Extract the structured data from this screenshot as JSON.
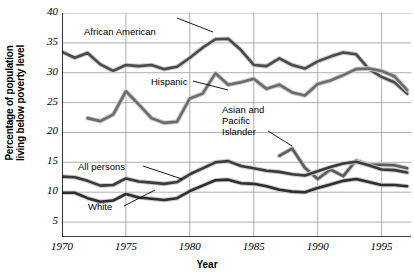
{
  "chart_data": {
    "type": "line",
    "title": "",
    "xlabel": "Year",
    "ylabel": "Percentage of population living below poverty level",
    "ylabel_line1": "Percentage of population",
    "ylabel_line2": "living below poverty level",
    "xlim": [
      1970,
      1997.3
    ],
    "ylim": [
      2.5,
      40
    ],
    "grid": true,
    "legend_position": "inline-annotations",
    "xticks": [
      1970,
      1975,
      1980,
      1985,
      1990,
      1995
    ],
    "xticklabels": [
      "1970",
      "1975",
      "1980",
      "1985",
      "1990",
      "1995"
    ],
    "yticks": [
      5,
      10,
      15,
      20,
      25,
      30,
      35,
      40
    ],
    "yticklabels": [
      "5",
      "10",
      "15",
      "20",
      "25",
      "30",
      "35",
      "40"
    ],
    "annotations": [
      {
        "text": "African American",
        "x_px": 84,
        "y_px": 26,
        "leader": true
      },
      {
        "text": "Hispanic",
        "x_px": 151,
        "y_px": 76,
        "leader": true
      },
      {
        "text": "Asian and",
        "x_px": 222,
        "y_px": 104,
        "leader": false
      },
      {
        "text": "Pacific",
        "x_px": 222,
        "y_px": 115,
        "leader": false
      },
      {
        "text": "Islander",
        "x_px": 222,
        "y_px": 126,
        "leader": true
      },
      {
        "text": "All persons",
        "x_px": 78,
        "y_px": 161,
        "leader": true
      },
      {
        "text": "White",
        "x_px": 88,
        "y_px": 201,
        "leader": true
      }
    ],
    "series": [
      {
        "name": "African American",
        "color": "#4a4a4a",
        "x": [
          1970,
          1971,
          1972,
          1973,
          1974,
          1975,
          1976,
          1977,
          1978,
          1979,
          1980,
          1981,
          1982,
          1983,
          1984,
          1985,
          1986,
          1987,
          1988,
          1989,
          1990,
          1991,
          1992,
          1993,
          1994,
          1995,
          1996,
          1997
        ],
        "values": [
          33.5,
          32.5,
          33.3,
          31.4,
          30.3,
          31.3,
          31.1,
          31.3,
          30.6,
          31.0,
          32.5,
          34.2,
          35.6,
          35.7,
          33.8,
          31.3,
          31.1,
          32.4,
          31.3,
          30.7,
          31.9,
          32.7,
          33.4,
          33.1,
          30.6,
          29.3,
          28.4,
          26.5
        ]
      },
      {
        "name": "Hispanic",
        "color": "#6b6b6b",
        "x": [
          1972,
          1973,
          1974,
          1975,
          1976,
          1977,
          1978,
          1979,
          1980,
          1981,
          1982,
          1983,
          1984,
          1985,
          1986,
          1987,
          1988,
          1989,
          1990,
          1991,
          1992,
          1993,
          1994,
          1995,
          1996,
          1997
        ],
        "values": [
          22.4,
          21.9,
          23.0,
          26.9,
          24.7,
          22.4,
          21.6,
          21.8,
          25.7,
          26.5,
          29.9,
          28.0,
          28.4,
          29.0,
          27.3,
          28.0,
          26.7,
          26.2,
          28.1,
          28.7,
          29.6,
          30.6,
          30.7,
          30.3,
          29.4,
          27.1
        ]
      },
      {
        "name": "Asian and Pacific Islander",
        "color": "#5a5a5a",
        "x": [
          1987,
          1988,
          1989,
          1990,
          1991,
          1992,
          1993,
          1994,
          1995,
          1996,
          1997
        ],
        "values": [
          16.1,
          17.3,
          14.1,
          12.2,
          13.8,
          12.7,
          15.3,
          14.6,
          14.6,
          14.5,
          14.0
        ]
      },
      {
        "name": "All persons",
        "color": "#3a3a3a",
        "x": [
          1970,
          1971,
          1972,
          1973,
          1974,
          1975,
          1976,
          1977,
          1978,
          1979,
          1980,
          1981,
          1982,
          1983,
          1984,
          1985,
          1986,
          1987,
          1988,
          1989,
          1990,
          1991,
          1992,
          1993,
          1994,
          1995,
          1996,
          1997
        ],
        "values": [
          12.6,
          12.5,
          11.9,
          11.1,
          11.2,
          12.3,
          11.8,
          11.6,
          11.4,
          11.7,
          13.0,
          14.0,
          15.0,
          15.2,
          14.4,
          14.0,
          13.6,
          13.4,
          13.0,
          12.8,
          13.5,
          14.2,
          14.8,
          15.1,
          14.5,
          13.8,
          13.7,
          13.3
        ]
      },
      {
        "name": "White",
        "color": "#2e2e2e",
        "x": [
          1970,
          1971,
          1972,
          1973,
          1974,
          1975,
          1976,
          1977,
          1978,
          1979,
          1980,
          1981,
          1982,
          1983,
          1984,
          1985,
          1986,
          1987,
          1988,
          1989,
          1990,
          1991,
          1992,
          1993,
          1994,
          1995,
          1996,
          1997
        ],
        "values": [
          9.9,
          9.9,
          9.0,
          8.4,
          8.6,
          9.7,
          9.1,
          8.9,
          8.7,
          9.0,
          10.2,
          11.1,
          12.0,
          12.1,
          11.5,
          11.4,
          11.0,
          10.4,
          10.1,
          10.0,
          10.7,
          11.3,
          11.9,
          12.2,
          11.7,
          11.2,
          11.2,
          11.0
        ]
      }
    ]
  }
}
